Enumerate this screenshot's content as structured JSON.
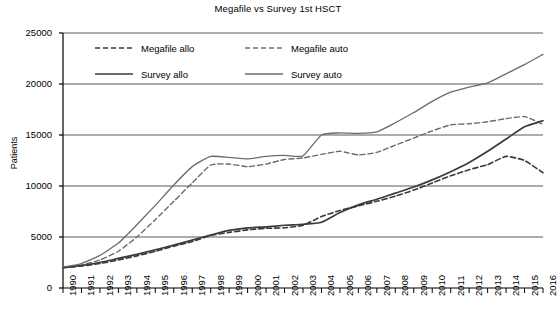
{
  "chart_data": {
    "type": "line",
    "title": "Megafile vs Survey 1st HSCT",
    "xlabel": "",
    "ylabel": "Patients",
    "ylim": [
      0,
      25000
    ],
    "y_ticks": [
      0,
      5000,
      10000,
      15000,
      20000,
      25000
    ],
    "grid": "horizontal",
    "legend_position": "top-left-inside",
    "categories": [
      "1990",
      "1991",
      "1992",
      "1993",
      "1994",
      "1995",
      "1996",
      "1997",
      "1998",
      "1999",
      "2000",
      "2001",
      "2002",
      "2003",
      "2004",
      "2005",
      "2006",
      "2007",
      "2008",
      "2009",
      "2010",
      "2011",
      "2012",
      "2013",
      "2014",
      "2015",
      "2016"
    ],
    "series": [
      {
        "name": "Megafile allo",
        "style": "dashed",
        "color": "#3a3a3a",
        "width": 1.6,
        "values": [
          2000,
          2150,
          2400,
          2750,
          3150,
          3600,
          4100,
          4550,
          5150,
          5450,
          5700,
          5850,
          5900,
          6150,
          7000,
          7600,
          8050,
          8500,
          9000,
          9600,
          10300,
          11000,
          11600,
          12100,
          12900,
          12500,
          11300
        ]
      },
      {
        "name": "Megafile auto",
        "style": "dashed",
        "color": "#6b6b6b",
        "width": 1.4,
        "values": [
          2000,
          2250,
          2750,
          3600,
          5000,
          6700,
          8500,
          10300,
          12050,
          12150,
          11900,
          12150,
          12600,
          12750,
          13100,
          13400,
          13050,
          13300,
          14000,
          14700,
          15400,
          16000,
          16100,
          16300,
          16600,
          16800,
          16050
        ]
      },
      {
        "name": "Survey allo",
        "style": "solid",
        "color": "#3a3a3a",
        "width": 1.7,
        "values": [
          2000,
          2200,
          2500,
          2900,
          3300,
          3750,
          4200,
          4700,
          5200,
          5650,
          5900,
          6000,
          6150,
          6250,
          6450,
          7400,
          8150,
          8700,
          9300,
          9900,
          10600,
          11400,
          12300,
          13400,
          14600,
          15800,
          16400
        ]
      },
      {
        "name": "Survey auto",
        "style": "solid",
        "color": "#6b6b6b",
        "width": 1.3,
        "values": [
          2050,
          2400,
          3200,
          4400,
          6200,
          8100,
          10100,
          11900,
          12900,
          12800,
          12650,
          12900,
          13000,
          12950,
          15000,
          15200,
          15150,
          15300,
          16200,
          17200,
          18300,
          19200,
          19700,
          20100,
          21000,
          21900,
          22900
        ]
      }
    ]
  },
  "legend": {
    "items": [
      {
        "label": "Megafile allo"
      },
      {
        "label": "Megafile auto"
      },
      {
        "label": "Survey allo"
      },
      {
        "label": "Survey auto"
      }
    ]
  },
  "colors": {
    "axis": "#000000",
    "grid": "#595959",
    "background": "#ffffff"
  }
}
